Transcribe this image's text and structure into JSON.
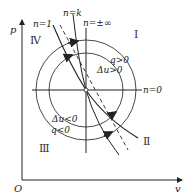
{
  "diagram": {
    "axes": {
      "y_label": "p",
      "x_label": "v",
      "origin_label": "O"
    },
    "quadrants": {
      "I": "Ⅰ",
      "II": "Ⅱ",
      "III": "Ⅲ",
      "IV": "Ⅳ"
    },
    "process_lines": {
      "n1": "n=1",
      "nk": "n=k",
      "ninf": "n=±∞",
      "n0": "n=0"
    },
    "regions": {
      "q_pos": "q>0",
      "du_pos": "Δu>0",
      "du_neg": "Δu<0",
      "q_neg": "q<0"
    },
    "colors": {
      "ink": "#222222",
      "background": "#ffffff"
    }
  }
}
